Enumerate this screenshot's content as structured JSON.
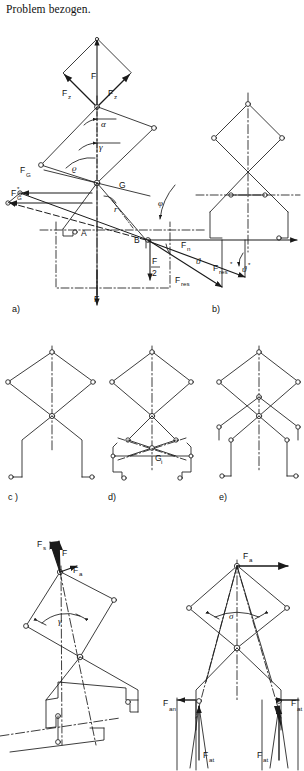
{
  "figure": {
    "caption_top": "Problem bezogen.",
    "panels": [
      {
        "id": "a",
        "label": "a)"
      },
      {
        "id": "b",
        "label": "b)"
      },
      {
        "id": "c",
        "label": "c )"
      },
      {
        "id": "d",
        "label": "d)"
      },
      {
        "id": "e",
        "label": "e)"
      }
    ]
  },
  "panel_a": {
    "force_labels": [
      {
        "name": "F",
        "text": "F"
      },
      {
        "name": "Fz-left",
        "text": "F",
        "sub": "z"
      },
      {
        "name": "Fz-right",
        "text": "F",
        "sub": "z"
      },
      {
        "name": "FG",
        "text": "F",
        "sub": "G"
      },
      {
        "name": "FG-star",
        "text": "F",
        "sub": "G",
        "sup": "*"
      },
      {
        "name": "F-bottom",
        "text": "F"
      },
      {
        "name": "F-half",
        "text": "F",
        "denom": "2"
      }
    ],
    "angles": [
      {
        "name": "alpha",
        "text": "α"
      },
      {
        "name": "gamma",
        "text": "γ"
      },
      {
        "name": "rho",
        "text": "ϱ"
      },
      {
        "name": "phi",
        "text": "φ"
      }
    ],
    "points": [
      {
        "name": "point-A",
        "text": "A"
      },
      {
        "name": "point-B",
        "text": "B"
      },
      {
        "name": "point-G",
        "text": "G"
      },
      {
        "name": "radius",
        "text": "r"
      }
    ]
  },
  "panel_b": {
    "force_labels": [
      {
        "name": "Fn",
        "text": "F",
        "sub": "n"
      },
      {
        "name": "Fres",
        "text": "F",
        "sub": "res"
      },
      {
        "name": "Fres-star",
        "text": "F",
        "sub": "res",
        "sup": "*"
      }
    ],
    "angles": [
      {
        "name": "theta",
        "text": "ϑ"
      },
      {
        "name": "theta-star",
        "text": "ϑ",
        "sup": "*"
      }
    ]
  },
  "panel_d": {
    "points": [
      {
        "name": "center-of-gravity",
        "text": "G",
        "sub": "i"
      }
    ]
  },
  "panel_f": {
    "force_labels": [
      {
        "name": "Fs",
        "text": "F",
        "sub": "s"
      },
      {
        "name": "F",
        "text": "F"
      },
      {
        "name": "Fa",
        "text": "F",
        "sub": "a"
      }
    ],
    "angles": [
      {
        "name": "gamma",
        "text": "γ"
      }
    ]
  },
  "panel_g": {
    "force_labels": [
      {
        "name": "Fa",
        "text": "F",
        "sub": "a"
      },
      {
        "name": "Fan",
        "text": "F",
        "sub": "an"
      },
      {
        "name": "Fat-left",
        "text": "F",
        "sub": "at"
      },
      {
        "name": "Fat-right",
        "text": "F",
        "sub": "at"
      },
      {
        "name": "Fat-outer",
        "text": "F",
        "sub": "at"
      }
    ],
    "angles": [
      {
        "name": "sigma",
        "text": "σ"
      }
    ]
  },
  "style": {
    "line_color": "#1a1a1a",
    "background": "#ffffff"
  }
}
